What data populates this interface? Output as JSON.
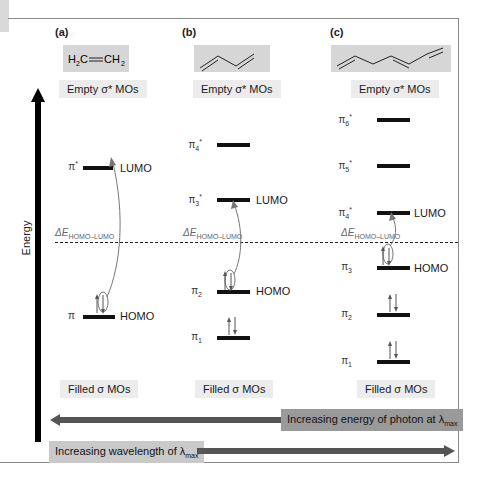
{
  "axis": {
    "label": "Energy"
  },
  "separator": {
    "label_prefix": "ΔE",
    "label_sub": "HOMO–LUMO"
  },
  "panels": [
    {
      "id": "a",
      "label": "(a)",
      "molecule": {
        "formula_parts": [
          "H",
          "2",
          "C",
          "══",
          "CH",
          "2"
        ],
        "text": "H2C=CH2"
      },
      "empty_label": "Empty σ* MOs",
      "filled_label": "Filled σ MOs",
      "levels": [
        {
          "name": "π*",
          "role": "LUMO",
          "electrons": 0
        },
        {
          "name": "π",
          "role": "HOMO",
          "electrons": 2
        }
      ]
    },
    {
      "id": "b",
      "label": "(b)",
      "molecule": {
        "text": "1,3-butadiene (skeletal)"
      },
      "empty_label": "Empty σ* MOs",
      "filled_label": "Filled σ MOs",
      "levels": [
        {
          "name": "π4*",
          "role": "",
          "electrons": 0
        },
        {
          "name": "π3*",
          "role": "LUMO",
          "electrons": 0
        },
        {
          "name": "π2",
          "role": "HOMO",
          "electrons": 2
        },
        {
          "name": "π1",
          "role": "",
          "electrons": 2
        }
      ]
    },
    {
      "id": "c",
      "label": "(c)",
      "molecule": {
        "text": "1,3,5-hexatriene (skeletal)"
      },
      "empty_label": "Empty σ* MOs",
      "filled_label": "Filled σ MOs",
      "levels": [
        {
          "name": "π6*",
          "role": "",
          "electrons": 0
        },
        {
          "name": "π5*",
          "role": "",
          "electrons": 0
        },
        {
          "name": "π4*",
          "role": "LUMO",
          "electrons": 0
        },
        {
          "name": "π3",
          "role": "HOMO",
          "electrons": 2
        },
        {
          "name": "π2",
          "role": "",
          "electrons": 2
        },
        {
          "name": "π1",
          "role": "",
          "electrons": 2
        }
      ]
    }
  ],
  "arrows": {
    "energy": {
      "text": "Increasing energy of photon at λ",
      "sub": "max",
      "direction": "left"
    },
    "wavelength": {
      "text": "Increasing wavelength of λ",
      "sub": "max",
      "direction": "right"
    }
  },
  "symbols": {
    "up_arrow": "↑",
    "down_arrow": "↓",
    "pi": "π",
    "star": "*"
  },
  "colors": {
    "level": "#111111",
    "arrow": "#555555",
    "energy_box": "#9a9a9a",
    "wave_box": "#c9c9c9",
    "tag_bg": "#ececec",
    "mol_bg": "#d6d6d6"
  }
}
